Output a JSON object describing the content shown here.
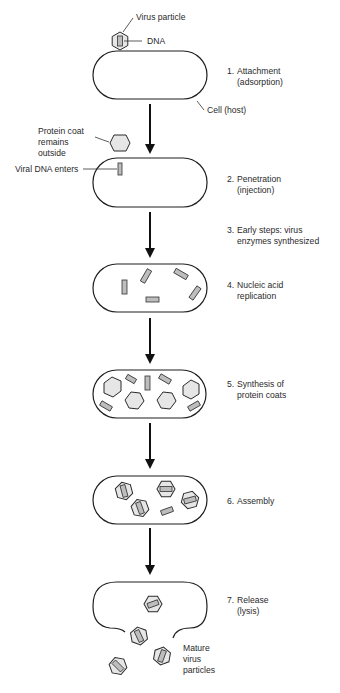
{
  "labels": {
    "virus_particle": "Virus particle",
    "dna": "DNA",
    "cell_host": "Cell (host)",
    "protein_coat_1": "Protein coat",
    "protein_coat_2": "remains",
    "protein_coat_3": "outside",
    "viral_dna_enters": "Viral DNA enters",
    "mature_1": "Mature",
    "mature_2": "virus",
    "mature_3": "particles"
  },
  "steps": [
    {
      "number": "1.",
      "line1": "Attachment",
      "line2": "(adsorption)"
    },
    {
      "number": "2.",
      "line1": "Penetration",
      "line2": "(injection)"
    },
    {
      "number": "3.",
      "line1": "Early steps: virus",
      "line2": "enzymes synthesized"
    },
    {
      "number": "4.",
      "line1": "Nucleic acid",
      "line2": "replication"
    },
    {
      "number": "5.",
      "line1": "Synthesis of",
      "line2": "protein coats"
    },
    {
      "number": "6.",
      "line1": "Assembly",
      "line2": ""
    },
    {
      "number": "7.",
      "line1": "Release",
      "line2": "(lysis)"
    }
  ],
  "colors": {
    "outline": "#1f1f1f",
    "capsid_fill": "#e6e6e6",
    "dna_fill": "#bdbdbd",
    "background": "#ffffff"
  }
}
